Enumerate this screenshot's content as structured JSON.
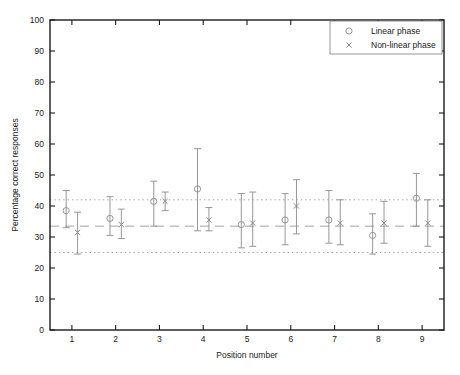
{
  "chart_data": {
    "type": "scatter",
    "title": "",
    "xlabel": "Position number",
    "ylabel": "Percentage correct responses",
    "xlim": [
      0.5,
      9.5
    ],
    "ylim": [
      0,
      100
    ],
    "grid": false,
    "x": [
      1,
      2,
      3,
      4,
      5,
      6,
      7,
      8,
      9
    ],
    "xticklabels": [
      "1",
      "2",
      "3",
      "4",
      "5",
      "6",
      "7",
      "8",
      "9"
    ],
    "yticks": [
      0,
      10,
      20,
      30,
      40,
      50,
      60,
      70,
      80,
      90,
      100
    ],
    "yticklabels": [
      "0",
      "10",
      "20",
      "30",
      "40",
      "50",
      "60",
      "70",
      "80",
      "90",
      "100"
    ],
    "legend_position": "upper right",
    "series": [
      {
        "name": "Linear phase",
        "marker": "circle",
        "color": "#8c8c8c",
        "values": [
          38.5,
          36.0,
          41.5,
          45.5,
          34.0,
          35.5,
          35.5,
          30.5,
          42.5
        ],
        "err_low": [
          33.0,
          30.5,
          33.5,
          32.0,
          26.5,
          27.5,
          28.0,
          24.5,
          33.5
        ],
        "err_high": [
          45.0,
          43.0,
          48.0,
          58.5,
          44.0,
          44.0,
          45.0,
          37.5,
          50.5
        ]
      },
      {
        "name": "Non-linear phase",
        "marker": "x",
        "color": "#8c8c8c",
        "values": [
          31.5,
          34.0,
          41.5,
          35.5,
          34.5,
          40.0,
          34.5,
          34.5,
          34.5
        ],
        "err_low": [
          24.5,
          29.5,
          38.5,
          32.0,
          27.0,
          31.0,
          27.5,
          28.0,
          27.0
        ],
        "err_high": [
          38.0,
          39.0,
          44.5,
          39.5,
          44.5,
          48.5,
          42.0,
          41.5,
          42.0
        ]
      }
    ],
    "reference_lines": [
      {
        "name": "upper-dotted",
        "y": 42.0,
        "style": "dotted"
      },
      {
        "name": "mean-dashed",
        "y": 33.5,
        "style": "dashed"
      },
      {
        "name": "lower-dotted",
        "y": 25.0,
        "style": "dotted"
      }
    ]
  },
  "legend": {
    "entries": [
      {
        "label": "Linear phase",
        "marker": "circle"
      },
      {
        "label": "Non-linear phase",
        "marker": "x"
      }
    ]
  }
}
